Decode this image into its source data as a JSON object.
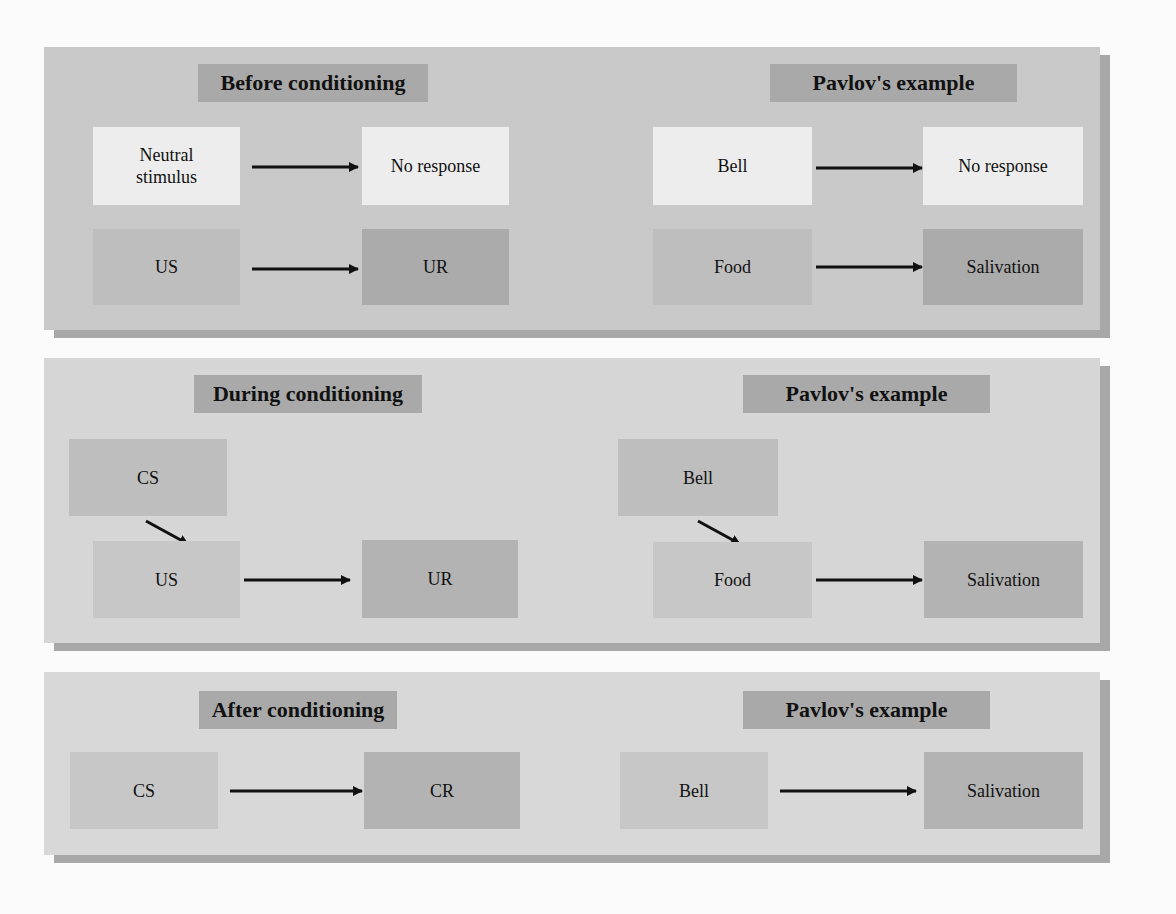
{
  "diagram": {
    "colors": {
      "page_bg": "#fbfbfb",
      "panel_bg": "#c9c9c9",
      "title_bg": "#a9a9a9",
      "neutral_box": "#ededed",
      "stimulus_box": "#bebebe",
      "response_box": "#ababab",
      "shadow": "#a8a8a8"
    }
  },
  "panels": [
    {
      "title": "Before conditioning",
      "example_title": "Pavlov's example",
      "rows": [
        {
          "from": "Neutral stimulus",
          "to": "No response",
          "ex_from": "Bell",
          "ex_to": "No response"
        },
        {
          "from": "US",
          "to": "UR",
          "ex_from": "Food",
          "ex_to": "Salivation"
        }
      ]
    },
    {
      "title": "During conditioning",
      "example_title": "Pavlov's example",
      "paired": {
        "cs": "CS",
        "ex_cs": "Bell"
      },
      "rows": [
        {
          "from": "US",
          "to": "UR",
          "ex_from": "Food",
          "ex_to": "Salivation"
        }
      ]
    },
    {
      "title": "After conditioning",
      "example_title": "Pavlov's example",
      "rows": [
        {
          "from": "CS",
          "to": "CR",
          "ex_from": "Bell",
          "ex_to": "Salivation"
        }
      ]
    }
  ]
}
